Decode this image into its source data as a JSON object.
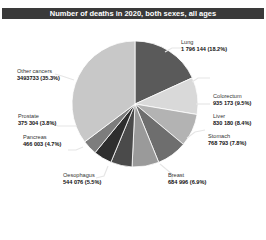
{
  "chart_data": {
    "type": "pie",
    "title": "Number of deaths in 2020, both sexes, all ages",
    "slices": [
      {
        "label": "Lung",
        "value": 1796144,
        "value_text": "1 796 144",
        "percent": 18.2,
        "percent_text": "(18.2%)",
        "color": "#5a5a5a"
      },
      {
        "label": "Colorectum",
        "value": 935173,
        "value_text": "935 173",
        "percent": 9.5,
        "percent_text": "(9.5%)",
        "color": "#d9d9d9"
      },
      {
        "label": "Liver",
        "value": 830180,
        "value_text": "830 180",
        "percent": 8.4,
        "percent_text": "(8.4%)",
        "color": "#b3b3b3"
      },
      {
        "label": "Stomach",
        "value": 768793,
        "value_text": "768 793",
        "percent": 7.8,
        "percent_text": "(7.8%)",
        "color": "#6e6e6e"
      },
      {
        "label": "Breast",
        "value": 684996,
        "value_text": "684 996",
        "percent": 6.9,
        "percent_text": "(6.9%)",
        "color": "#9a9a9a"
      },
      {
        "label": "Oesophagus",
        "value": 544076,
        "value_text": "544 076",
        "percent": 5.5,
        "percent_text": "(5.5%)",
        "color": "#4a4a4a"
      },
      {
        "label": "Pancreas",
        "value": 466003,
        "value_text": "466 003",
        "percent": 4.7,
        "percent_text": "(4.7%)",
        "color": "#2e2e2e"
      },
      {
        "label": "Prostate",
        "value": 375304,
        "value_text": "375 304",
        "percent": 3.8,
        "percent_text": "(3.8%)",
        "color": "#7d7d7d"
      },
      {
        "label": "Other cancers",
        "value": 3493733,
        "value_text": "3493733",
        "percent": 35.3,
        "percent_text": "(35.3%)",
        "color": "#c8c8c8"
      }
    ],
    "start_angle_deg": 0,
    "direction": "clockwise",
    "legend": "none (direct labels)"
  },
  "header": {
    "title": "Number of deaths in 2020, both sexes, all ages"
  },
  "labels": {
    "lung": {
      "name": "Lung",
      "value": "1 796 144 (18.2%)"
    },
    "colorectum": {
      "name": "Colorectum",
      "value": "935 173 (9.5%)"
    },
    "liver": {
      "name": "Liver",
      "value": "830 180 (8.4%)"
    },
    "stomach": {
      "name": "Stomach",
      "value": "768 793 (7.8%)"
    },
    "breast": {
      "name": "Breast",
      "value": "684 996 (6.9%)"
    },
    "oesophagus": {
      "name": "Oesophagus",
      "value": "544 076 (5.5%)"
    },
    "pancreas": {
      "name": "Pancreas",
      "value": "466 003 (4.7%)"
    },
    "prostate": {
      "name": "Prostate",
      "value": "375 304 (3.8%)"
    },
    "other": {
      "name": "Other cancers",
      "value": "3493733 (35.3%)"
    }
  }
}
